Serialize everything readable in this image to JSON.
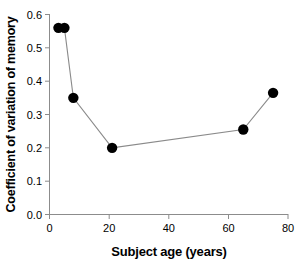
{
  "chart_data": {
    "type": "scatter",
    "title": "",
    "xlabel": "Subject age (years)",
    "ylabel": "Coefficient of variation of memory",
    "xlim": [
      0,
      80
    ],
    "ylim": [
      0.0,
      0.6
    ],
    "grid": false,
    "legend": false,
    "marker": "filled-circle",
    "marker_color": "#000000",
    "line_color": "#808080",
    "connected": true,
    "x": [
      3,
      5,
      8,
      21,
      65,
      75
    ],
    "y": [
      0.56,
      0.56,
      0.35,
      0.2,
      0.255,
      0.365
    ],
    "points": [
      {
        "x": 3,
        "y": 0.56
      },
      {
        "x": 5,
        "y": 0.56
      },
      {
        "x": 8,
        "y": 0.35
      },
      {
        "x": 21,
        "y": 0.2
      },
      {
        "x": 65,
        "y": 0.255
      },
      {
        "x": 75,
        "y": 0.365
      }
    ],
    "xticks": [
      0,
      20,
      40,
      60,
      80
    ],
    "xtick_labels": [
      "0",
      "20",
      "40",
      "60",
      "80"
    ],
    "yticks": [
      0.0,
      0.1,
      0.2,
      0.3,
      0.4,
      0.5,
      0.6
    ],
    "ytick_labels": [
      "0.0",
      "0.1",
      "0.2",
      "0.3",
      "0.4",
      "0.5",
      "0.6"
    ]
  },
  "axes": {
    "x_title": "Subject age (years)",
    "y_title": "Coefficient of variation of memory"
  },
  "ticks": {
    "x": [
      "0",
      "20",
      "40",
      "60",
      "80"
    ],
    "y": [
      "0.0",
      "0.1",
      "0.2",
      "0.3",
      "0.4",
      "0.5",
      "0.6"
    ]
  },
  "colors": {
    "axis": "#8c8c8c",
    "marker": "#000000",
    "line": "#8a8a8a",
    "text": "#000000",
    "background": "#ffffff"
  }
}
